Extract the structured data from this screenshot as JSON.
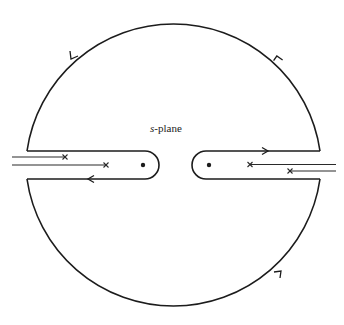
{
  "diagram": {
    "title_var": "s",
    "title_rest": "-plane",
    "elements": {
      "contour": "closed contour: large circle with two keyhole indentations along the real axis",
      "left_indent": {
        "pole": "dot",
        "branch_cut_ends": [
          "x",
          "x"
        ]
      },
      "right_indent": {
        "pole": "dot",
        "branch_cut_ends": [
          "x",
          "x"
        ]
      },
      "orientation": "counter-clockwise"
    },
    "arrows": [
      {
        "location": "upper-left arc",
        "direction": "down-left"
      },
      {
        "location": "upper-right arc",
        "direction": "up-left"
      },
      {
        "location": "right indent upper line",
        "direction": "right"
      },
      {
        "location": "left indent lower line",
        "direction": "left"
      },
      {
        "location": "lower-right arc",
        "direction": "up-right"
      }
    ],
    "colors": {
      "ink": "#1c1c1c",
      "background": "#ffffff"
    }
  }
}
